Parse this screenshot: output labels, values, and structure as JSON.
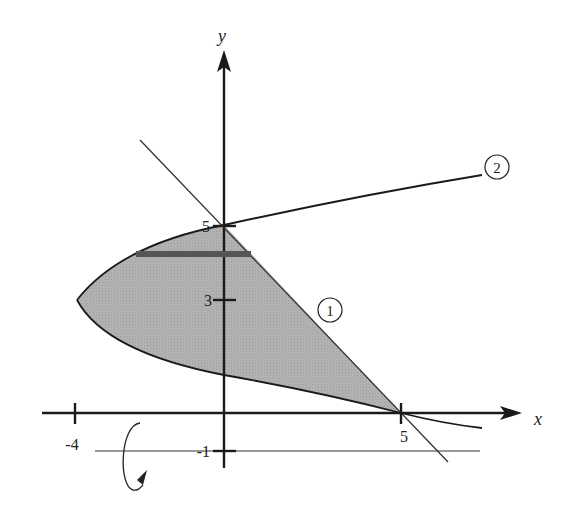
{
  "diagram": {
    "axes": {
      "x_label": "x",
      "y_label": "y"
    },
    "ticks": {
      "x": [
        {
          "value": -4,
          "label": "-4"
        },
        {
          "value": 5,
          "label": "5"
        }
      ],
      "y": [
        {
          "value": 5,
          "label": "5"
        },
        {
          "value": 3,
          "label": "3"
        },
        {
          "value": -1,
          "label": "-1"
        }
      ]
    },
    "curves": [
      {
        "id": "line-1",
        "label": "1",
        "equation": "x + y = 5"
      },
      {
        "id": "curve-2",
        "label": "2",
        "equation": "x = (y - 3)^2 - 4"
      }
    ],
    "shaded_region": "Region bounded by curve 2 and line 1, between (0,5) and (5,0)",
    "rotation_axis": {
      "y": -1,
      "label": "-1"
    },
    "rectangle_strip_y": 4.4,
    "colors": {
      "shade": "#b0b0b0",
      "strip": "#555555",
      "axis": "#1a1a1a"
    }
  }
}
